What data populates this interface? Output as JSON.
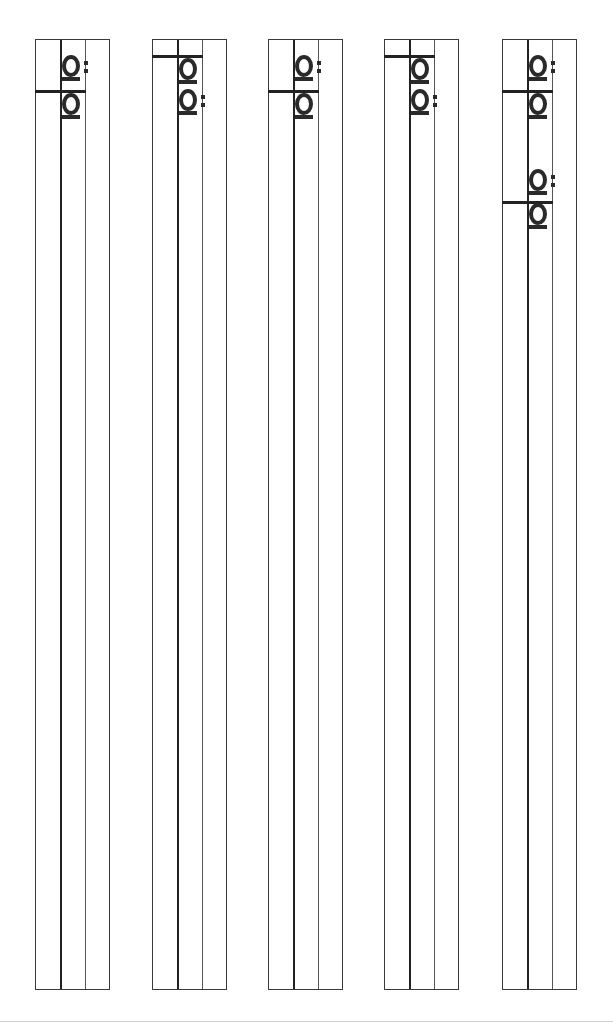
{
  "document": {
    "type": "handwriting practice worksheet (rotated)",
    "strips": [
      {
        "left": 35,
        "glyphs": [
          {
            "char": "ä",
            "top": 52,
            "rotated": true
          },
          {
            "char": "a",
            "top": 90,
            "rotated": true
          }
        ],
        "hbar_top": 89,
        "hbar_left": 0
      },
      {
        "left": 152,
        "glyphs": [
          {
            "char": "a",
            "top": 55,
            "rotated": true
          },
          {
            "char": "ä",
            "top": 86,
            "rotated": true
          }
        ],
        "hbar_top": 54,
        "hbar_left": 0
      },
      {
        "left": 268,
        "glyphs": [
          {
            "char": "ä",
            "top": 52,
            "rotated": true
          },
          {
            "char": "a",
            "top": 90,
            "rotated": true
          }
        ],
        "hbar_top": 89,
        "hbar_left": 0
      },
      {
        "left": 384,
        "glyphs": [
          {
            "char": "a",
            "top": 55,
            "rotated": true
          },
          {
            "char": "ä",
            "top": 86,
            "rotated": true
          }
        ],
        "hbar_top": 54,
        "hbar_left": 0
      },
      {
        "left": 502,
        "glyphs": [
          {
            "char": "ä",
            "top": 52,
            "rotated": true
          },
          {
            "char": "a",
            "top": 90,
            "rotated": true
          },
          {
            "char": "ä",
            "top": 166,
            "rotated": true
          },
          {
            "char": "a",
            "top": 200,
            "rotated": true
          }
        ],
        "hbar_top": 89,
        "hbar_top2": 200,
        "hbar_left": 0
      }
    ]
  }
}
